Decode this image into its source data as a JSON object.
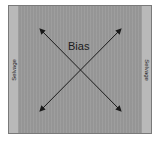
{
  "diagram": {
    "title_label": "Bias",
    "selvage_left": "Selvage",
    "selvage_right": "Selvage",
    "colors": {
      "fabric": "#9a9a9a",
      "selvage": "#b9b9b9",
      "arrow": "#1a1a1a"
    },
    "arrows": [
      {
        "name": "bias-diagonal-1",
        "from": [
          40,
          29
        ],
        "to": [
          121,
          111
        ],
        "heads": "both"
      },
      {
        "name": "bias-diagonal-2",
        "from": [
          121,
          29
        ],
        "to": [
          40,
          111
        ],
        "heads": "both"
      }
    ]
  }
}
